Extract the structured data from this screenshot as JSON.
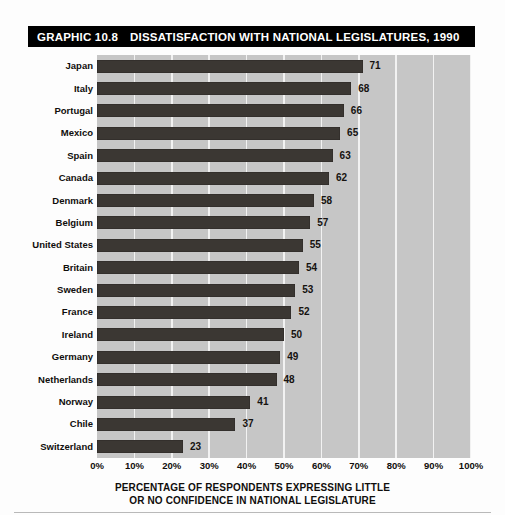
{
  "title": {
    "number": "GRAPHIC 10.8",
    "text": "DISSATISFACTION WITH NATIONAL LEGISLATURES, 1990"
  },
  "caption": {
    "line1": "PERCENTAGE OF RESPONDENTS EXPRESSING LITTLE",
    "line2": "OR NO CONFIDENCE IN NATIONAL LEGISLATURE"
  },
  "colors": {
    "bar": "#3b3733",
    "plot_background": "#c6c6c6",
    "gridline": "#f2f2f2",
    "title_background": "#000000",
    "title_text": "#ffffff"
  },
  "chart_data": {
    "type": "bar",
    "orientation": "horizontal",
    "title": "GRAPHIC 10.8  DISSATISFACTION WITH NATIONAL LEGISLATURES, 1990",
    "xlabel": "PERCENTAGE OF RESPONDENTS EXPRESSING LITTLE OR NO CONFIDENCE IN NATIONAL LEGISLATURE",
    "ylabel": "",
    "xlim": [
      0,
      100
    ],
    "grid": true,
    "legend": false,
    "tick_labels": [
      "0%",
      "10%",
      "20%",
      "30%",
      "40%",
      "50%",
      "60%",
      "70%",
      "80%",
      "90%",
      "100%"
    ],
    "tick_values": [
      0,
      10,
      20,
      30,
      40,
      50,
      60,
      70,
      80,
      90,
      100
    ],
    "categories": [
      "Japan",
      "Italy",
      "Portugal",
      "Mexico",
      "Spain",
      "Canada",
      "Denmark",
      "Belgium",
      "United States",
      "Britain",
      "Sweden",
      "France",
      "Ireland",
      "Germany",
      "Netherlands",
      "Norway",
      "Chile",
      "Switzerland"
    ],
    "values": [
      71,
      68,
      66,
      65,
      63,
      62,
      58,
      57,
      55,
      54,
      53,
      52,
      50,
      49,
      48,
      41,
      37,
      23
    ],
    "value_labels": [
      "71",
      "68",
      "66",
      "65",
      "63",
      "62",
      "58",
      "57",
      "55",
      "54",
      "53",
      "52",
      "50",
      "49",
      "48",
      "41",
      "37",
      "23"
    ]
  }
}
